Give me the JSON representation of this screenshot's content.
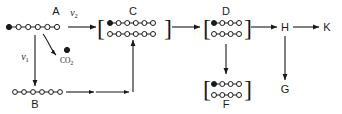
{
  "diagram": {
    "type": "reaction-pathway",
    "background_color": "#ffffff",
    "ink_color": "#1a1a1a",
    "nodes": [
      {
        "id": "A",
        "label": "A",
        "label_x": 56,
        "label_y": 15,
        "bracketed": false,
        "chains": [
          {
            "x": 9,
            "y": 27,
            "spacing": 9.6,
            "atoms": [
              "filled",
              "open",
              "open",
              "open",
              "open",
              "open"
            ]
          }
        ]
      },
      {
        "id": "B",
        "label": "B",
        "label_x": 35,
        "label_y": 108,
        "bracketed": false,
        "chains": [
          {
            "x": 15,
            "y": 92,
            "spacing": 9.0,
            "atoms": [
              "open",
              "open",
              "open",
              "open",
              "open",
              "open"
            ]
          }
        ]
      },
      {
        "id": "C",
        "label": "C",
        "label_x": 133,
        "label_y": 15,
        "bracketed": true,
        "bracket_left_x": 100,
        "bracket_right_x": 166,
        "bracket_y": 27,
        "chains": [
          {
            "x": 110,
            "y": 23,
            "spacing": 8.6,
            "atoms": [
              "filled",
              "open",
              "open",
              "open",
              "open",
              "open"
            ]
          },
          {
            "x": 110,
            "y": 34,
            "spacing": 8.6,
            "atoms": [
              "open",
              "open",
              "open",
              "open",
              "open",
              "open"
            ]
          }
        ]
      },
      {
        "id": "D",
        "label": "D",
        "label_x": 226,
        "label_y": 15,
        "bracketed": true,
        "bracket_left_x": 205,
        "bracket_right_x": 247,
        "bracket_y": 27,
        "chains": [
          {
            "x": 214,
            "y": 23,
            "spacing": 8.6,
            "atoms": [
              "filled",
              "open",
              "open",
              "open"
            ]
          },
          {
            "x": 214,
            "y": 34,
            "spacing": 8.6,
            "atoms": [
              "open",
              "open",
              "open",
              "open"
            ]
          }
        ]
      },
      {
        "id": "F",
        "label": "F",
        "label_x": 226,
        "label_y": 108,
        "bracketed": true,
        "bracket_left_x": 205,
        "bracket_right_x": 247,
        "bracket_y": 88,
        "chains": [
          {
            "x": 214,
            "y": 84,
            "spacing": 8.6,
            "atoms": [
              "filled",
              "open",
              "open",
              "open"
            ]
          },
          {
            "x": 214,
            "y": 95,
            "spacing": 8.6,
            "atoms": [
              "open",
              "open",
              "open",
              "open"
            ]
          }
        ]
      },
      {
        "id": "H",
        "label": "H",
        "label_x": 285,
        "label_y": 31,
        "bracketed": false,
        "chains": []
      },
      {
        "id": "K",
        "label": "K",
        "label_x": 327,
        "label_y": 31,
        "bracketed": false,
        "chains": []
      },
      {
        "id": "G",
        "label": "G",
        "label_x": 285,
        "label_y": 93,
        "bracketed": false,
        "chains": []
      }
    ],
    "rate_labels": [
      {
        "id": "v2",
        "base": "v",
        "subscript": "2",
        "x": 72,
        "y": 14,
        "source": "A",
        "target": "C"
      },
      {
        "id": "v1",
        "base": "v",
        "subscript": "1",
        "x": 26,
        "y": 58,
        "source": "A",
        "target": "B"
      }
    ],
    "byproduct": {
      "id": "co2",
      "label": "CO",
      "subscript": "2",
      "label_x": 62,
      "label_y": 62,
      "dot_x": 66,
      "dot_y": 49,
      "dot_state": "filled"
    },
    "edges": [
      {
        "id": "A-to-C",
        "from": "A",
        "to": "C",
        "style": "straight-horizontal",
        "label": "v2"
      },
      {
        "id": "A-to-B",
        "from": "A",
        "to": "B",
        "style": "straight-vertical",
        "label": "v1"
      },
      {
        "id": "A-to-CO2",
        "from": "A",
        "to": "co2",
        "style": "curved",
        "label": ""
      },
      {
        "id": "B-to-riser",
        "from": "B",
        "to": "C",
        "style": "elbow-up",
        "label": ""
      },
      {
        "id": "C-to-D",
        "from": "C",
        "to": "D",
        "style": "straight-horizontal",
        "label": ""
      },
      {
        "id": "D-to-F",
        "from": "D",
        "to": "F",
        "style": "straight-vertical",
        "label": ""
      },
      {
        "id": "D-to-H",
        "from": "D",
        "to": "H",
        "style": "straight-horizontal",
        "label": ""
      },
      {
        "id": "H-to-K",
        "from": "H",
        "to": "K",
        "style": "straight-horizontal",
        "label": ""
      },
      {
        "id": "H-to-G",
        "from": "H",
        "to": "G",
        "style": "straight-vertical",
        "label": ""
      }
    ]
  }
}
